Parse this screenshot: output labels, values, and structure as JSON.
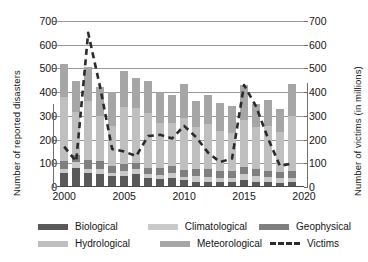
{
  "chart_data": {
    "type": "bar",
    "title": "",
    "subtitle": "",
    "xlabel": "",
    "ylabel": "Number of reported disasters",
    "y2label": "Number of  victims  (in millions)",
    "ylim": [
      0,
      700
    ],
    "y2lim": [
      0,
      700
    ],
    "ytick_labels": [
      "700",
      "600",
      "500",
      "400",
      "300",
      "200",
      "100",
      "0"
    ],
    "y2tick_labels": [
      "700",
      "600",
      "500",
      "400",
      "300",
      "200",
      "100",
      "0"
    ],
    "yticks": [
      700,
      600,
      500,
      400,
      300,
      200,
      100,
      0
    ],
    "xtick_labels": [
      "2000",
      "2005",
      "2010",
      "2015",
      "2020"
    ],
    "xticks": [
      2000,
      2005,
      2010,
      2015,
      2020
    ],
    "xlim": [
      1999.4,
      2020.0
    ],
    "grid": "horizontal",
    "legend_position": "bottom",
    "stacked": true,
    "categories": [
      "2000",
      "2001",
      "2002",
      "2003",
      "2004",
      "2005",
      "2006",
      "2007",
      "2008",
      "2009",
      "2010",
      "2011",
      "2012",
      "2013",
      "2014",
      "2015",
      "2016",
      "2017",
      "2018",
      "2019"
    ],
    "series": [
      {
        "name": "Biological",
        "color": "#595959",
        "values": [
          60,
          80,
          58,
          55,
          45,
          48,
          53,
          38,
          33,
          40,
          28,
          22,
          20,
          22,
          20,
          28,
          22,
          20,
          18,
          22
        ]
      },
      {
        "name": "Climatological",
        "color": "#c9c9c9",
        "values": [
          18,
          24,
          20,
          20,
          16,
          18,
          22,
          18,
          18,
          20,
          16,
          24,
          24,
          18,
          20,
          26,
          24,
          22,
          20,
          18
        ]
      },
      {
        "name": "Geophysical",
        "color": "#7f7f7f",
        "values": [
          30,
          32,
          34,
          34,
          26,
          30,
          28,
          26,
          28,
          30,
          28,
          28,
          30,
          26,
          26,
          30,
          28,
          26,
          26,
          28
        ]
      },
      {
        "name": "Hydrological",
        "color": "#bfbfbf",
        "values": [
          270,
          180,
          250,
          190,
          170,
          240,
          230,
          230,
          190,
          180,
          220,
          180,
          190,
          170,
          160,
          200,
          180,
          190,
          170,
          230
        ]
      },
      {
        "name": "Meteorological",
        "color": "#a6a6a6",
        "values": [
          142,
          131,
          143,
          123,
          143,
          154,
          126,
          135,
          128,
          120,
          143,
          110,
          126,
          118,
          116,
          146,
          95,
          108,
          96,
          136
        ]
      },
      {
        "name": "Victims",
        "color": "#2b2b2b",
        "style": "dashed-line",
        "axis": "right",
        "values": [
          170,
          108,
          650,
          420,
          160,
          150,
          130,
          215,
          220,
          205,
          258,
          210,
          145,
          105,
          120,
          430,
          340,
          205,
          88,
          100
        ]
      }
    ],
    "totals": [
      520,
      447,
      505,
      422,
      400,
      490,
      459,
      447,
      397,
      390,
      435,
      364,
      390,
      354,
      342,
      430,
      349,
      366,
      330,
      434
    ]
  },
  "legend": {
    "rows": [
      [
        {
          "label": "Biological",
          "swatch": "color-swatch-biological",
          "kind": "fill"
        },
        {
          "label": "Climatological",
          "swatch": "color-swatch-climatological",
          "kind": "fill"
        },
        {
          "label": "Geophysical",
          "swatch": "color-swatch-geophysical",
          "kind": "fill"
        }
      ],
      [
        {
          "label": "Hydrological",
          "swatch": "color-swatch-hydrological",
          "kind": "fill"
        },
        {
          "label": "Meteorological",
          "swatch": "color-swatch-meteorological",
          "kind": "fill"
        },
        {
          "label": "Victims",
          "swatch": "line-swatch-victims",
          "kind": "dash"
        }
      ]
    ]
  },
  "colors": {
    "biological": "#595959",
    "climatological": "#c9c9c9",
    "geophysical": "#7f7f7f",
    "hydrological": "#bfbfbf",
    "meteorological": "#a6a6a6",
    "victims": "#2b2b2b",
    "grid": "#9a9a9a",
    "axis": "#4a4a4a",
    "background": "#ffffff"
  }
}
